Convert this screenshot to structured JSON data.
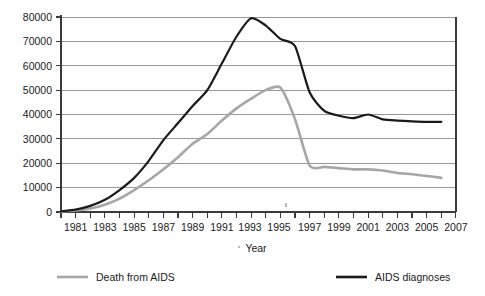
{
  "chart_data": {
    "type": "line",
    "title": "",
    "xlabel": "Year",
    "ylabel": "",
    "xlim": [
      1980,
      2007
    ],
    "ylim": [
      0,
      80000
    ],
    "grid": true,
    "legend_position": "bottom",
    "x_major_ticks": [
      1981,
      1983,
      1985,
      1987,
      1989,
      1991,
      1993,
      1995,
      1997,
      1999,
      2001,
      2003,
      2005,
      2007
    ],
    "x_minor_ticks": [
      1980,
      1982,
      1984,
      1986,
      1988,
      1990,
      1992,
      1994,
      1996,
      1998,
      2000,
      2002,
      2004,
      2006
    ],
    "y_ticks": [
      0,
      10000,
      20000,
      30000,
      40000,
      50000,
      60000,
      70000,
      80000
    ],
    "x": [
      1980,
      1981,
      1982,
      1983,
      1984,
      1985,
      1986,
      1987,
      1988,
      1989,
      1990,
      1991,
      1992,
      1993,
      1994,
      1995,
      1996,
      1997,
      1998,
      1999,
      2000,
      2001,
      2002,
      2003,
      2004,
      2005,
      2006
    ],
    "series": [
      {
        "name": "AIDS diagnoses",
        "color": "#1a1a1a",
        "values": [
          300,
          1000,
          2500,
          5000,
          9000,
          14000,
          21000,
          29500,
          36500,
          43500,
          50000,
          61000,
          72000,
          79500,
          76500,
          71000,
          68000,
          49000,
          41500,
          39500,
          38500,
          40000,
          38000,
          37500,
          37200,
          37000,
          37000
        ]
      },
      {
        "name": "Death from AIDS",
        "color": "#a6a6a6",
        "values": [
          200,
          600,
          1400,
          3000,
          5500,
          9000,
          13000,
          17500,
          22500,
          28000,
          32000,
          37500,
          42500,
          46500,
          50000,
          51000,
          38000,
          19000,
          18500,
          18000,
          17500,
          17500,
          17000,
          16000,
          15500,
          14800,
          14000
        ]
      }
    ],
    "legend": [
      {
        "label": "Death from AIDS",
        "color": "#a6a6a6"
      },
      {
        "label": "AIDS diagnoses",
        "color": "#1a1a1a"
      }
    ]
  },
  "y_tick_labels": {
    "t0": "0",
    "t1": "10000",
    "t2": "20000",
    "t3": "30000",
    "t4": "40000",
    "t5": "50000",
    "t6": "60000",
    "t7": "70000",
    "t8": "80000"
  },
  "x_tick_labels": {
    "x1981": "1981",
    "x1983": "1983",
    "x1985": "1985",
    "x1987": "1987",
    "x1989": "1989",
    "x1991": "1991",
    "x1993": "1993",
    "x1995": "1995",
    "x1997": "1997",
    "x1999": "1999",
    "x2001": "2001",
    "x2003": "2003",
    "x2005": "2005",
    "x2007": "2007"
  },
  "axis": {
    "x_title": "Year"
  },
  "legend": {
    "left_label": "Death from AIDS",
    "right_label": "AIDS diagnoses"
  }
}
